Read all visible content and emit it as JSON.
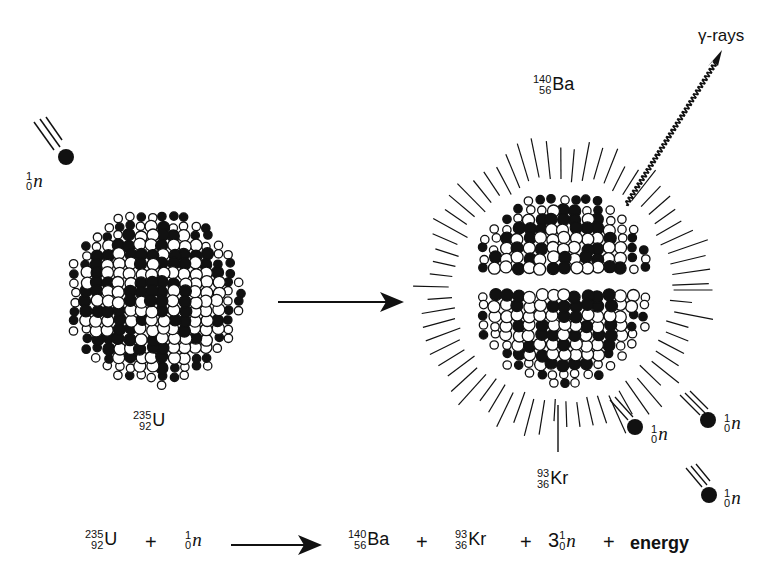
{
  "diagram": {
    "incoming_neutron": {
      "mass": "1",
      "atomic": "0",
      "symbol": "n"
    },
    "uranium": {
      "mass": "235",
      "atomic": "92",
      "symbol": "U"
    },
    "barium": {
      "mass": "140",
      "atomic": "56",
      "symbol": "Ba"
    },
    "krypton": {
      "mass": "93",
      "atomic": "36",
      "symbol": "Kr"
    },
    "gamma_label": "γ-rays",
    "released_neutrons": [
      {
        "mass": "1",
        "atomic": "0",
        "symbol": "n"
      },
      {
        "mass": "1",
        "atomic": "0",
        "symbol": "n"
      },
      {
        "mass": "1",
        "atomic": "0",
        "symbol": "n"
      }
    ],
    "colors": {
      "ink": "#111111",
      "background": "#ffffff"
    }
  },
  "equation": {
    "reactant1": {
      "mass": "235",
      "atomic": "92",
      "symbol": "U"
    },
    "plus1": "+",
    "reactant2": {
      "mass": "1",
      "atomic": "0",
      "symbol": "n"
    },
    "product1": {
      "mass": "140",
      "atomic": "56",
      "symbol": "Ba"
    },
    "plus2": "+",
    "product2": {
      "mass": "93",
      "atomic": "36",
      "symbol": "Kr"
    },
    "plus3": "+",
    "product3_coefficient": "3",
    "product3": {
      "mass": "1",
      "atomic": "0",
      "symbol": "n"
    },
    "plus4": "+",
    "energy": "energy"
  }
}
